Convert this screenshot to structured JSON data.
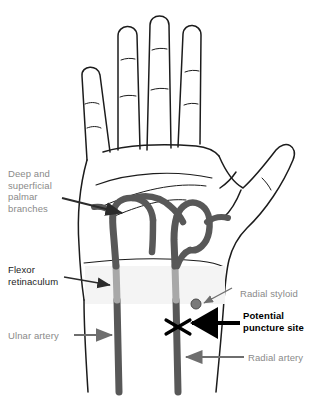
{
  "colors": {
    "outline": "#1c1c1c",
    "artery": "#585858",
    "artery_light": "#a8a8a8",
    "retinaculum_band": "#f2f2f2",
    "label_gray": "#8a8a8a",
    "label_dark": "#1c1c1c",
    "label_bold": "#000000",
    "arrow_gray": "#6e6e6e",
    "arrow_dark": "#2b2b2b",
    "styloid_dot": "#7a7a7a",
    "background": "#ffffff"
  },
  "labels": {
    "deep_superficial_palmar_branches": "Deep and\nsuperficial\npalmar\nbranches",
    "flexor_retinaculum": "Flexor\nretinaculum",
    "ulnar_artery": "Ulnar artery",
    "radial_styloid": "Radial styloid",
    "potential_puncture_site": "Potential\npuncture site",
    "radial_artery": "Radial artery"
  },
  "annotations": [
    {
      "name": "deep-superficial-palmar-branches",
      "text_color": "label_gray",
      "arrow": "dark",
      "points_to": "palmar arch"
    },
    {
      "name": "flexor-retinaculum",
      "text_color": "label_dark",
      "arrow": "dark",
      "points_to": "wrist retinaculum band"
    },
    {
      "name": "ulnar-artery",
      "text_color": "label_gray",
      "arrow": "gray",
      "points_to": "left forearm vessel"
    },
    {
      "name": "radial-styloid",
      "text_color": "label_gray",
      "arrow": "gray-thin",
      "points_to": "styloid dot"
    },
    {
      "name": "potential-puncture-site",
      "text_color": "label_bold",
      "arrow": "black-thick",
      "points_to": "X marker on radial artery"
    },
    {
      "name": "radial-artery",
      "text_color": "label_gray",
      "arrow": "gray",
      "points_to": "right forearm vessel"
    }
  ],
  "markers": {
    "puncture_x": "X",
    "styloid_dot": "filled circle"
  }
}
